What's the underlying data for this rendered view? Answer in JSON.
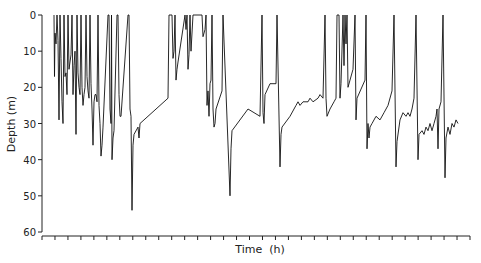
{
  "chart_data": {
    "type": "line",
    "title": "",
    "xlabel": "Time  (h)",
    "ylabel": "Depth  (m)",
    "ylim": [
      0,
      60
    ],
    "y_inverted": true,
    "yticks": [
      0,
      10,
      20,
      30,
      40,
      50,
      60
    ],
    "xtick_count": 34,
    "xtick_labels": [],
    "grid": false,
    "legend": null,
    "series": [
      {
        "name": "dive depth",
        "color": "#111111",
        "points_px_x_depth_m": [
          [
            54,
            0
          ],
          [
            54.5,
            17
          ],
          [
            55,
            5
          ],
          [
            56,
            8
          ],
          [
            57,
            0
          ],
          [
            58,
            7
          ],
          [
            59,
            29
          ],
          [
            60,
            0
          ],
          [
            61,
            12
          ],
          [
            62,
            24
          ],
          [
            63,
            30
          ],
          [
            64,
            0
          ],
          [
            65,
            17
          ],
          [
            66,
            16
          ],
          [
            67,
            22
          ],
          [
            68,
            0
          ],
          [
            69,
            15
          ],
          [
            70,
            13
          ],
          [
            71,
            11
          ],
          [
            72,
            0
          ],
          [
            73,
            22
          ],
          [
            74,
            14
          ],
          [
            75,
            10
          ],
          [
            76,
            33
          ],
          [
            77,
            0
          ],
          [
            78,
            16
          ],
          [
            79,
            20
          ],
          [
            80,
            22
          ],
          [
            81,
            0
          ],
          [
            82,
            20
          ],
          [
            83,
            25
          ],
          [
            84,
            22
          ],
          [
            85,
            20
          ],
          [
            86,
            0
          ],
          [
            87,
            17
          ],
          [
            88,
            21
          ],
          [
            89,
            23
          ],
          [
            90,
            0
          ],
          [
            91,
            19
          ],
          [
            92,
            26
          ],
          [
            93,
            36
          ],
          [
            94,
            24
          ],
          [
            95,
            22
          ],
          [
            96,
            22
          ],
          [
            97,
            24
          ],
          [
            98,
            0
          ],
          [
            99,
            25
          ],
          [
            100,
            30
          ],
          [
            101,
            39
          ],
          [
            102,
            36
          ],
          [
            103,
            31
          ],
          [
            108,
            0
          ],
          [
            109,
            0
          ],
          [
            110,
            26
          ],
          [
            111,
            30
          ],
          [
            111.5,
            0
          ],
          [
            112,
            40
          ],
          [
            113,
            34
          ],
          [
            114,
            32
          ],
          [
            117,
            0
          ],
          [
            118,
            0
          ],
          [
            119,
            22
          ],
          [
            120,
            28
          ],
          [
            121,
            28
          ],
          [
            128,
            0
          ],
          [
            129,
            0
          ],
          [
            130,
            26
          ],
          [
            131,
            28
          ],
          [
            132,
            54
          ],
          [
            133,
            36
          ],
          [
            134,
            33
          ],
          [
            138,
            31
          ],
          [
            139,
            34
          ],
          [
            140,
            30
          ],
          [
            168,
            23
          ],
          [
            169,
            0
          ],
          [
            172,
            0
          ],
          [
            173,
            12
          ],
          [
            174,
            10
          ],
          [
            175,
            0
          ],
          [
            176,
            18
          ],
          [
            177,
            15
          ],
          [
            178,
            13
          ],
          [
            185,
            0
          ],
          [
            186,
            4
          ],
          [
            187,
            0
          ],
          [
            188,
            15
          ],
          [
            189,
            11
          ],
          [
            190,
            0
          ],
          [
            191,
            10
          ],
          [
            193,
            0
          ],
          [
            202,
            0
          ],
          [
            203,
            6
          ],
          [
            205,
            4
          ],
          [
            206,
            0
          ],
          [
            207,
            25
          ],
          [
            208,
            21
          ],
          [
            209,
            28
          ],
          [
            210,
            19
          ],
          [
            211,
            18
          ],
          [
            212,
            0
          ],
          [
            213,
            26
          ],
          [
            214,
            31
          ],
          [
            215,
            30
          ],
          [
            216,
            26
          ],
          [
            222,
            21
          ],
          [
            223,
            0
          ],
          [
            230,
            50
          ],
          [
            231,
            37
          ],
          [
            232,
            32
          ],
          [
            248,
            26
          ],
          [
            260,
            28
          ],
          [
            262,
            0
          ],
          [
            263,
            27
          ],
          [
            264,
            30
          ],
          [
            265,
            22
          ],
          [
            270,
            19
          ],
          [
            276,
            19
          ],
          [
            277,
            0
          ],
          [
            280,
            42
          ],
          [
            281,
            33
          ],
          [
            282,
            31
          ],
          [
            290,
            28
          ],
          [
            294,
            26
          ],
          [
            296,
            25
          ],
          [
            298,
            24
          ],
          [
            300,
            25
          ],
          [
            303,
            24
          ],
          [
            308,
            24
          ],
          [
            310,
            23
          ],
          [
            313,
            24
          ],
          [
            318,
            23
          ],
          [
            320,
            22
          ],
          [
            323,
            23
          ],
          [
            325,
            0
          ],
          [
            326,
            23
          ],
          [
            327,
            28
          ],
          [
            330,
            26
          ],
          [
            334,
            24
          ],
          [
            336,
            23
          ],
          [
            337,
            0
          ],
          [
            339,
            0
          ],
          [
            340,
            23
          ],
          [
            341,
            19
          ],
          [
            343,
            0
          ],
          [
            344,
            14
          ],
          [
            345,
            0
          ],
          [
            346,
            8
          ],
          [
            347,
            0
          ],
          [
            348,
            20
          ],
          [
            350,
            18
          ],
          [
            353,
            15
          ],
          [
            355,
            0
          ],
          [
            356,
            29
          ],
          [
            357,
            23
          ],
          [
            365,
            18
          ],
          [
            366,
            0
          ],
          [
            367,
            37
          ],
          [
            368,
            30
          ],
          [
            369,
            34
          ],
          [
            370,
            31
          ],
          [
            372,
            30
          ],
          [
            376,
            28
          ],
          [
            380,
            29
          ],
          [
            384,
            27
          ],
          [
            388,
            25
          ],
          [
            392,
            21
          ],
          [
            394,
            0
          ],
          [
            396,
            42
          ],
          [
            397,
            35
          ],
          [
            400,
            29
          ],
          [
            403,
            27
          ],
          [
            406,
            28
          ],
          [
            408,
            27
          ],
          [
            410,
            28
          ],
          [
            412,
            26
          ],
          [
            414,
            23
          ],
          [
            416,
            0
          ],
          [
            418,
            40
          ],
          [
            419,
            33
          ],
          [
            422,
            32
          ],
          [
            424,
            33
          ],
          [
            426,
            31
          ],
          [
            428,
            32
          ],
          [
            430,
            30
          ],
          [
            432,
            32
          ],
          [
            434,
            30
          ],
          [
            436,
            28
          ],
          [
            437,
            26
          ],
          [
            438,
            37
          ],
          [
            439,
            26
          ],
          [
            441,
            24
          ],
          [
            443,
            0
          ],
          [
            445,
            45
          ],
          [
            446,
            34
          ],
          [
            448,
            31
          ],
          [
            450,
            33
          ],
          [
            452,
            30
          ],
          [
            454,
            31
          ],
          [
            456,
            29
          ],
          [
            458,
            30
          ]
        ]
      }
    ]
  }
}
